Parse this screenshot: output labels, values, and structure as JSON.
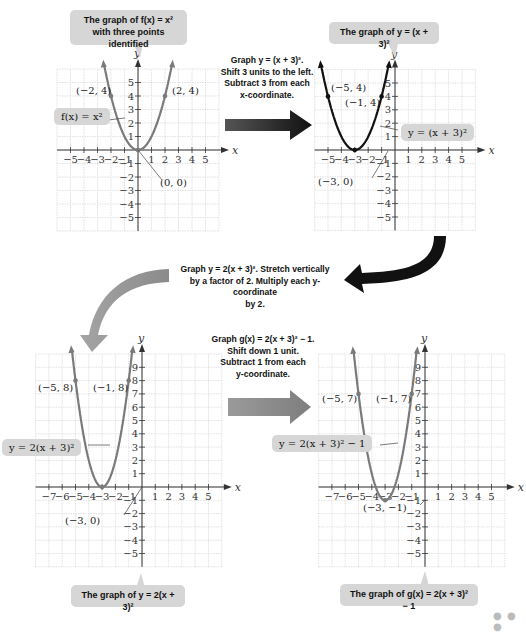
{
  "callouts": {
    "g1_title_line1": "The graph of f(x) = x²",
    "g1_title_line2": "with three points identified",
    "g2_title": "The graph of y = (x + 3)²",
    "g3_title": "The graph of y = 2(x + 3)²",
    "g4_title": "The graph of g(x) = 2(x + 3)² − 1"
  },
  "steps": {
    "step1": [
      "Graph y = (x + 3)².",
      "Shift 3 units to the left.",
      "Subtract 3 from each",
      "x-coordinate."
    ],
    "step2": [
      "Graph y = 2(x + 3)². Stretch vertically",
      "by a factor of 2. Multiply each y-coordinate",
      "by 2."
    ],
    "step3": [
      "Graph g(x) = 2(x + 3)² − 1.",
      "Shift down 1 unit.",
      "Subtract 1 from each",
      "y-coordinate."
    ]
  },
  "equation_labels": {
    "g1": "f(x) = x²",
    "g2": "y = (x + 3)²",
    "g3": "y = 2(x + 3)²",
    "g4": "y = 2(x + 3)² − 1"
  },
  "point_labels": {
    "g1": [
      "(−2, 4)",
      "(2, 4)",
      "(0, 0)"
    ],
    "g2": [
      "(−5, 4)",
      "(−1, 4)",
      "(−3, 0)"
    ],
    "g3": [
      "(−5, 8)",
      "(−1, 8)",
      "(−3, 0)"
    ],
    "g4": [
      "(−5, 7)",
      "(−1, 7)",
      "(−3, −1)"
    ]
  },
  "axis_labels": {
    "x": "x",
    "y": "y"
  },
  "colors": {
    "curve_gray": "#7a7a7a",
    "curve_black": "#111111",
    "grid": "#cfcfcf",
    "callout_bg": "#d6d6d6",
    "arrow_dark": "#1a1a1a",
    "arrow_gray": "#777777"
  },
  "more_dots": "● ● ●",
  "chart_data": [
    {
      "type": "line",
      "title": "The graph of f(x) = x² with three points identified",
      "function": "f(x) = x^2",
      "xlabel": "x",
      "ylabel": "y",
      "xlim": [
        -5,
        5
      ],
      "ylim": [
        -5,
        5
      ],
      "grid": true,
      "xticks": [
        -5,
        -4,
        -3,
        -2,
        -1,
        1,
        2,
        3,
        4,
        5
      ],
      "yticks": [
        -5,
        -4,
        -3,
        -2,
        -1,
        1,
        2,
        3,
        4,
        5
      ],
      "points": [
        {
          "x": -2,
          "y": 4
        },
        {
          "x": 0,
          "y": 0
        },
        {
          "x": 2,
          "y": 4
        }
      ]
    },
    {
      "type": "line",
      "title": "The graph of y = (x + 3)²",
      "function": "y = (x+3)^2",
      "xlabel": "x",
      "ylabel": "y",
      "xlim": [
        -5,
        5
      ],
      "ylim": [
        -5,
        5
      ],
      "grid": true,
      "xticks": [
        -5,
        -4,
        -3,
        -2,
        -1,
        1,
        2,
        3,
        4,
        5
      ],
      "yticks": [
        -5,
        -4,
        -3,
        -2,
        -1,
        1,
        2,
        3,
        4,
        5
      ],
      "points": [
        {
          "x": -5,
          "y": 4
        },
        {
          "x": -3,
          "y": 0
        },
        {
          "x": -1,
          "y": 4
        }
      ]
    },
    {
      "type": "line",
      "title": "The graph of y = 2(x + 3)²",
      "function": "y = 2(x+3)^2",
      "xlabel": "x",
      "ylabel": "y",
      "xlim": [
        -7,
        5
      ],
      "ylim": [
        -5,
        9
      ],
      "grid": true,
      "xticks": [
        -7,
        -6,
        -5,
        -4,
        -3,
        -2,
        -1,
        1,
        2,
        3,
        4,
        5
      ],
      "yticks": [
        -5,
        -4,
        -3,
        -2,
        -1,
        1,
        2,
        3,
        4,
        5,
        6,
        7,
        8,
        9
      ],
      "points": [
        {
          "x": -5,
          "y": 8
        },
        {
          "x": -3,
          "y": 0
        },
        {
          "x": -1,
          "y": 8
        }
      ]
    },
    {
      "type": "line",
      "title": "The graph of g(x) = 2(x + 3)² − 1",
      "function": "g(x) = 2(x+3)^2 - 1",
      "xlabel": "x",
      "ylabel": "y",
      "xlim": [
        -7,
        5
      ],
      "ylim": [
        -5,
        9
      ],
      "grid": true,
      "xticks": [
        -7,
        -6,
        -5,
        -4,
        -3,
        -2,
        -1,
        1,
        2,
        3,
        4,
        5
      ],
      "yticks": [
        -5,
        -4,
        -3,
        -2,
        -1,
        1,
        2,
        3,
        4,
        5,
        6,
        7,
        8,
        9
      ],
      "points": [
        {
          "x": -5,
          "y": 7
        },
        {
          "x": -3,
          "y": -1
        },
        {
          "x": -1,
          "y": 7
        }
      ]
    }
  ]
}
